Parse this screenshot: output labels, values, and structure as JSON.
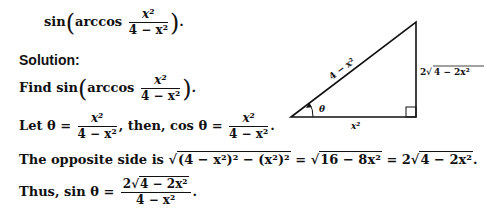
{
  "problem": {
    "fn": "sin",
    "inner_fn": "arccos",
    "numerator": "x²",
    "denominator": "4 − x²",
    "end": "."
  },
  "solution_heading": "Solution:",
  "steps": [
    {
      "prefix": "Find",
      "fn": "sin",
      "inner_fn": "arccos",
      "numerator": "x²",
      "denominator": "4 − x²",
      "end": "."
    },
    {
      "prefix": "Let θ =",
      "numerator": "x²",
      "denominator": "4 − x²",
      "middle": ", then, cos θ =",
      "numerator2": "x²",
      "denominator2": "4 − x²",
      "end": "."
    },
    {
      "prefix": "The opposite side is",
      "sqrt1": "(4 − x²)² − (x²)²",
      "eq1": "=",
      "sqrt2": "16 − 8x²",
      "eq2": "= 2",
      "sqrt3": "4 − 2x²",
      "end": "."
    },
    {
      "prefix": "Thus, sin θ =",
      "numerator_coef": "2",
      "numerator_sqrt": "4 − 2x²",
      "denominator": "4 − x²",
      "end": "."
    }
  ],
  "diagram": {
    "hypotenuse_label": "4 − x²",
    "adjacent_label": "x²",
    "opposite_label_coef": "2",
    "opposite_label_sqrt": "4 − 2x²",
    "angle_label": "θ"
  }
}
